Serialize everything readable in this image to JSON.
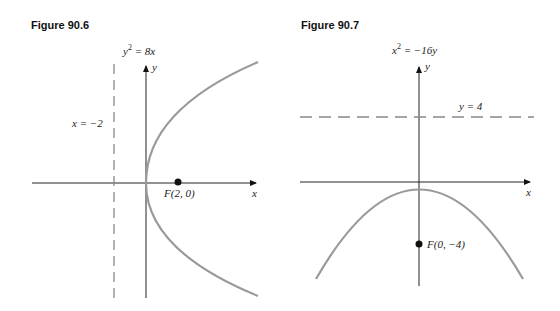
{
  "figures": [
    {
      "title": "Figure 90.6",
      "equation": {
        "base": "y",
        "exp": "2",
        "rest": " = 8x"
      },
      "directrix_label": "x = −2",
      "focus_label": "F(2, 0)",
      "x_axis_label": "x",
      "y_axis_label": "y",
      "curve_color": "#9a9a9a"
    },
    {
      "title": "Figure 90.7",
      "equation": {
        "base": "x",
        "exp": "2",
        "rest": " = −16y"
      },
      "directrix_label": "y = 4",
      "focus_label": "F(0, −4)",
      "x_axis_label": "x",
      "y_axis_label": "y",
      "curve_color": "#9a9a9a"
    }
  ]
}
